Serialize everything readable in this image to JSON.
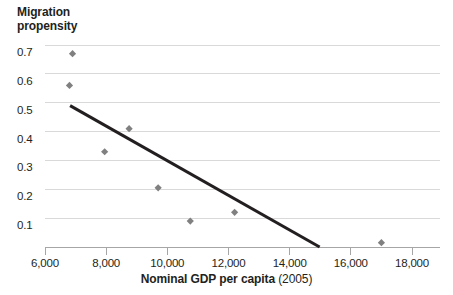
{
  "chart_data": {
    "type": "scatter",
    "title": "Migration propensity",
    "title_lines": [
      "Migration",
      "propensity"
    ],
    "xlabel_bold": "Nominal GDP per capita",
    "xlabel_light": "(2005)",
    "xlabel": "Nominal GDP per capita (2005)",
    "ylabel": "Migration propensity",
    "xlim": [
      5200,
      18800
    ],
    "ylim": [
      0,
      0.74
    ],
    "xticks": [
      6000,
      8000,
      10000,
      12000,
      14000,
      16000,
      18000
    ],
    "xtick_labels": [
      "6,000",
      "8,000",
      "10,000",
      "12,000",
      "14,000",
      "16,000",
      "18,000"
    ],
    "yticks": [
      0.1,
      0.2,
      0.3,
      0.4,
      0.5,
      0.6,
      0.7
    ],
    "ytick_labels": [
      "0.1",
      "0.2",
      "0.3",
      "0.4",
      "0.5",
      "0.6",
      "0.7"
    ],
    "grid": "horizontal",
    "legend": "none",
    "x": [
      6900,
      6800,
      7950,
      8750,
      9700,
      10750,
      12200,
      17000
    ],
    "y": [
      0.67,
      0.56,
      0.33,
      0.41,
      0.205,
      0.09,
      0.12,
      0.015
    ],
    "points": [
      {
        "x": 6900,
        "y": 0.67
      },
      {
        "x": 6800,
        "y": 0.56
      },
      {
        "x": 7950,
        "y": 0.33
      },
      {
        "x": 8750,
        "y": 0.41
      },
      {
        "x": 9700,
        "y": 0.205
      },
      {
        "x": 10750,
        "y": 0.09
      },
      {
        "x": 12200,
        "y": 0.12
      },
      {
        "x": 17000,
        "y": 0.015
      }
    ],
    "trendline": {
      "x": [
        6820,
        14980
      ],
      "y": [
        0.49,
        0.0
      ]
    },
    "colors": {
      "marker": "#808080",
      "trendline": "#231f20",
      "grid": "#d9d9d9",
      "axis": "#a6a6a6",
      "text": "#231f20",
      "background": "#ffffff"
    },
    "marker_shape": "diamond"
  }
}
